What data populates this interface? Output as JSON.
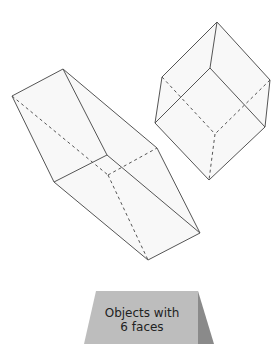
{
  "shapes": [
    {
      "name": "rectangular prism (tilted)",
      "faces": 6
    },
    {
      "name": "cube (tilted)",
      "faces": 6
    }
  ],
  "sort_card": {
    "line1": "Objects with",
    "line2": "6 faces"
  },
  "colors": {
    "edge": "#555555",
    "face_fill": "#f7f7f7",
    "card_front": "#bdbdbd",
    "card_side": "#8a8a8a"
  }
}
